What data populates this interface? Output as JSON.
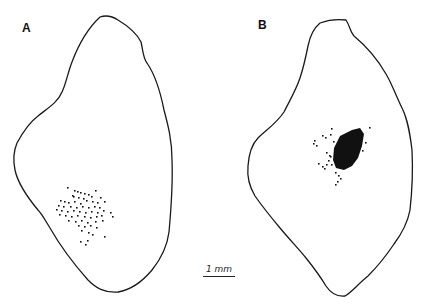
{
  "figure": {
    "panels": [
      {
        "label": "A",
        "distribution": "diffuse dot cluster in lower-left of outline"
      },
      {
        "label": "B",
        "distribution": "dense compact dot cluster in center of outline"
      }
    ],
    "scale_bar": {
      "text": "1 mm"
    },
    "colors": {
      "outline": "#1a1a1a",
      "dots": "#111111",
      "background": "#ffffff"
    }
  }
}
